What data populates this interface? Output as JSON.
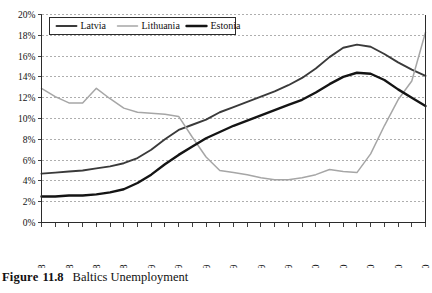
{
  "caption": {
    "label": "Figure",
    "number": "11.8",
    "title": "Baltics Unemployment"
  },
  "chart_data": {
    "type": "line",
    "title": "Baltics Unemployment",
    "xlabel": "",
    "ylabel": "",
    "ylim": [
      0,
      20
    ],
    "ytick_values": [
      0,
      2,
      4,
      6,
      8,
      10,
      12,
      14,
      16,
      18,
      20
    ],
    "ytick_labels": [
      "0%",
      "2%",
      "4%",
      "6%",
      "8%",
      "10%",
      "12%",
      "14%",
      "16%",
      "18%",
      "20%"
    ],
    "grid": true,
    "legend_position": "top-left",
    "x": [
      "May-08",
      "Jun-08",
      "Jul-08",
      "Aug-08",
      "Sep-08",
      "Oct-08",
      "Nov-08",
      "Dec-08",
      "Jan-09",
      "Feb-09",
      "Mar-09",
      "Apr-09",
      "May-09",
      "Jun-09",
      "Jul-09",
      "Aug-09",
      "Sep-09",
      "Oct-09",
      "Nov-09",
      "Dec-09",
      "Jan-10",
      "Feb-10",
      "Mar-10",
      "Apr-10",
      "May-10",
      "Jun-10",
      "Jul-10",
      "Aug-10",
      "Sep-10"
    ],
    "xtick_labels": [
      "May-08",
      "Jul-08",
      "Sep-08",
      "Nov-08",
      "Jan-09",
      "Mar-09",
      "May-09",
      "Jul-09",
      "Sep-09",
      "Nov-09",
      "Jan-10",
      "Mar-10",
      "May-10",
      "Jul-10",
      "Sep-10"
    ],
    "xtick_indices": [
      0,
      2,
      4,
      6,
      8,
      10,
      12,
      14,
      16,
      18,
      20,
      22,
      24,
      26,
      28
    ],
    "series": [
      {
        "name": "Latvia",
        "color": "#3a3a3a",
        "width": 1.9,
        "values": [
          4.7,
          4.8,
          4.9,
          5.0,
          5.2,
          5.4,
          5.7,
          6.2,
          7.0,
          8.0,
          8.9,
          9.4,
          9.9,
          10.6,
          11.1,
          11.6,
          12.1,
          12.6,
          13.2,
          13.9,
          14.8,
          15.9,
          16.8,
          17.1,
          16.9,
          16.2,
          15.4,
          14.7,
          14.1
        ]
      },
      {
        "name": "Lithuania",
        "color": "#a6a6a6",
        "width": 1.5,
        "values": [
          12.9,
          12.1,
          11.5,
          11.5,
          12.9,
          11.9,
          11.0,
          10.6,
          10.5,
          10.4,
          10.2,
          8.2,
          6.3,
          5.0,
          4.8,
          4.6,
          4.3,
          4.1,
          4.1,
          4.3,
          4.6,
          5.1,
          4.9,
          4.8,
          6.6,
          9.3,
          11.8,
          13.6,
          18.3
        ]
      },
      {
        "name": "Estonia",
        "color": "#141414",
        "width": 2.4,
        "values": [
          2.5,
          2.5,
          2.6,
          2.6,
          2.7,
          2.9,
          3.2,
          3.8,
          4.6,
          5.6,
          6.5,
          7.3,
          8.1,
          8.7,
          9.3,
          9.8,
          10.3,
          10.8,
          11.3,
          11.8,
          12.5,
          13.3,
          14.0,
          14.4,
          14.3,
          13.7,
          12.8,
          12.0,
          11.2
        ]
      }
    ]
  },
  "legend": {
    "items": [
      {
        "label": "Latvia"
      },
      {
        "label": "Lithuania"
      },
      {
        "label": "Estonia"
      }
    ]
  }
}
